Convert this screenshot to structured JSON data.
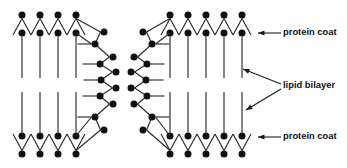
{
  "figure": {
    "width": 347,
    "height": 168,
    "background_color": "#ffffff",
    "ink_color": "#111111"
  },
  "callouts": [
    {
      "id": "protein-coat-top",
      "label": "protein coat",
      "text_x": 283,
      "text_y": 33,
      "arrows": [
        {
          "from_x": 281,
          "from_y": 33,
          "to_x": 258,
          "to_y": 33
        }
      ]
    },
    {
      "id": "lipid-bilayer",
      "label": "lipid bilayer",
      "text_x": 283,
      "text_y": 86,
      "arrows": [
        {
          "from_x": 281,
          "from_y": 84,
          "to_x": 243,
          "to_y": 69
        },
        {
          "from_x": 281,
          "from_y": 89,
          "to_x": 246,
          "to_y": 110
        }
      ]
    },
    {
      "id": "protein-coat-bottom",
      "label": "protein coat",
      "text_x": 283,
      "text_y": 137,
      "arrows": [
        {
          "from_x": 281,
          "from_y": 137,
          "to_x": 258,
          "to_y": 137
        }
      ]
    }
  ],
  "geometry": {
    "head_radius": 3.5,
    "left_membrane": {
      "id": "left-membrane",
      "outer_top_heads": [
        {
          "x": 22,
          "y": 15
        },
        {
          "x": 40,
          "y": 15
        },
        {
          "x": 58,
          "y": 15
        },
        {
          "x": 76,
          "y": 15
        }
      ],
      "inner_top_heads": [
        {
          "x": 22,
          "y": 33
        },
        {
          "x": 40,
          "y": 33
        },
        {
          "x": 58,
          "y": 33
        },
        {
          "x": 76,
          "y": 33
        }
      ],
      "outer_bottom_heads": [
        {
          "x": 22,
          "y": 154
        },
        {
          "x": 40,
          "y": 154
        },
        {
          "x": 58,
          "y": 154
        },
        {
          "x": 76,
          "y": 154
        }
      ],
      "inner_bottom_heads": [
        {
          "x": 22,
          "y": 136
        },
        {
          "x": 40,
          "y": 136
        },
        {
          "x": 58,
          "y": 136
        },
        {
          "x": 76,
          "y": 136
        }
      ],
      "cap_outer_heads": [
        {
          "x": 104,
          "y": 32
        },
        {
          "x": 113,
          "y": 57
        },
        {
          "x": 116,
          "y": 72
        },
        {
          "x": 116,
          "y": 88
        },
        {
          "x": 113,
          "y": 104
        },
        {
          "x": 104,
          "y": 130
        }
      ],
      "cap_inner_heads": [
        {
          "x": 95,
          "y": 44
        },
        {
          "x": 100,
          "y": 64
        },
        {
          "x": 101,
          "y": 80
        },
        {
          "x": 100,
          "y": 96
        },
        {
          "x": 95,
          "y": 117
        }
      ]
    },
    "right_membrane": {
      "id": "right-membrane",
      "outer_top_heads": [
        {
          "x": 170,
          "y": 15
        },
        {
          "x": 188,
          "y": 15
        },
        {
          "x": 206,
          "y": 15
        },
        {
          "x": 224,
          "y": 15
        },
        {
          "x": 242,
          "y": 15
        }
      ],
      "inner_top_heads": [
        {
          "x": 170,
          "y": 33
        },
        {
          "x": 188,
          "y": 33
        },
        {
          "x": 206,
          "y": 33
        },
        {
          "x": 224,
          "y": 33
        },
        {
          "x": 242,
          "y": 33
        }
      ],
      "outer_bottom_heads": [
        {
          "x": 170,
          "y": 154
        },
        {
          "x": 188,
          "y": 154
        },
        {
          "x": 206,
          "y": 154
        },
        {
          "x": 224,
          "y": 154
        },
        {
          "x": 242,
          "y": 154
        }
      ],
      "inner_bottom_heads": [
        {
          "x": 170,
          "y": 136
        },
        {
          "x": 188,
          "y": 136
        },
        {
          "x": 206,
          "y": 136
        },
        {
          "x": 224,
          "y": 136
        },
        {
          "x": 242,
          "y": 136
        }
      ],
      "cap_outer_heads": [
        {
          "x": 143,
          "y": 32
        },
        {
          "x": 134,
          "y": 57
        },
        {
          "x": 131,
          "y": 72
        },
        {
          "x": 131,
          "y": 88
        },
        {
          "x": 134,
          "y": 104
        },
        {
          "x": 143,
          "y": 130
        }
      ],
      "cap_inner_heads": [
        {
          "x": 152,
          "y": 44
        },
        {
          "x": 147,
          "y": 64
        },
        {
          "x": 146,
          "y": 80
        },
        {
          "x": 147,
          "y": 96
        },
        {
          "x": 152,
          "y": 117
        }
      ]
    },
    "tail_reach": {
      "top_inner_tail_end_y": 78,
      "bottom_inner_tail_end_y": 92,
      "v_spread": 9,
      "cap_tail_length": 14
    }
  }
}
